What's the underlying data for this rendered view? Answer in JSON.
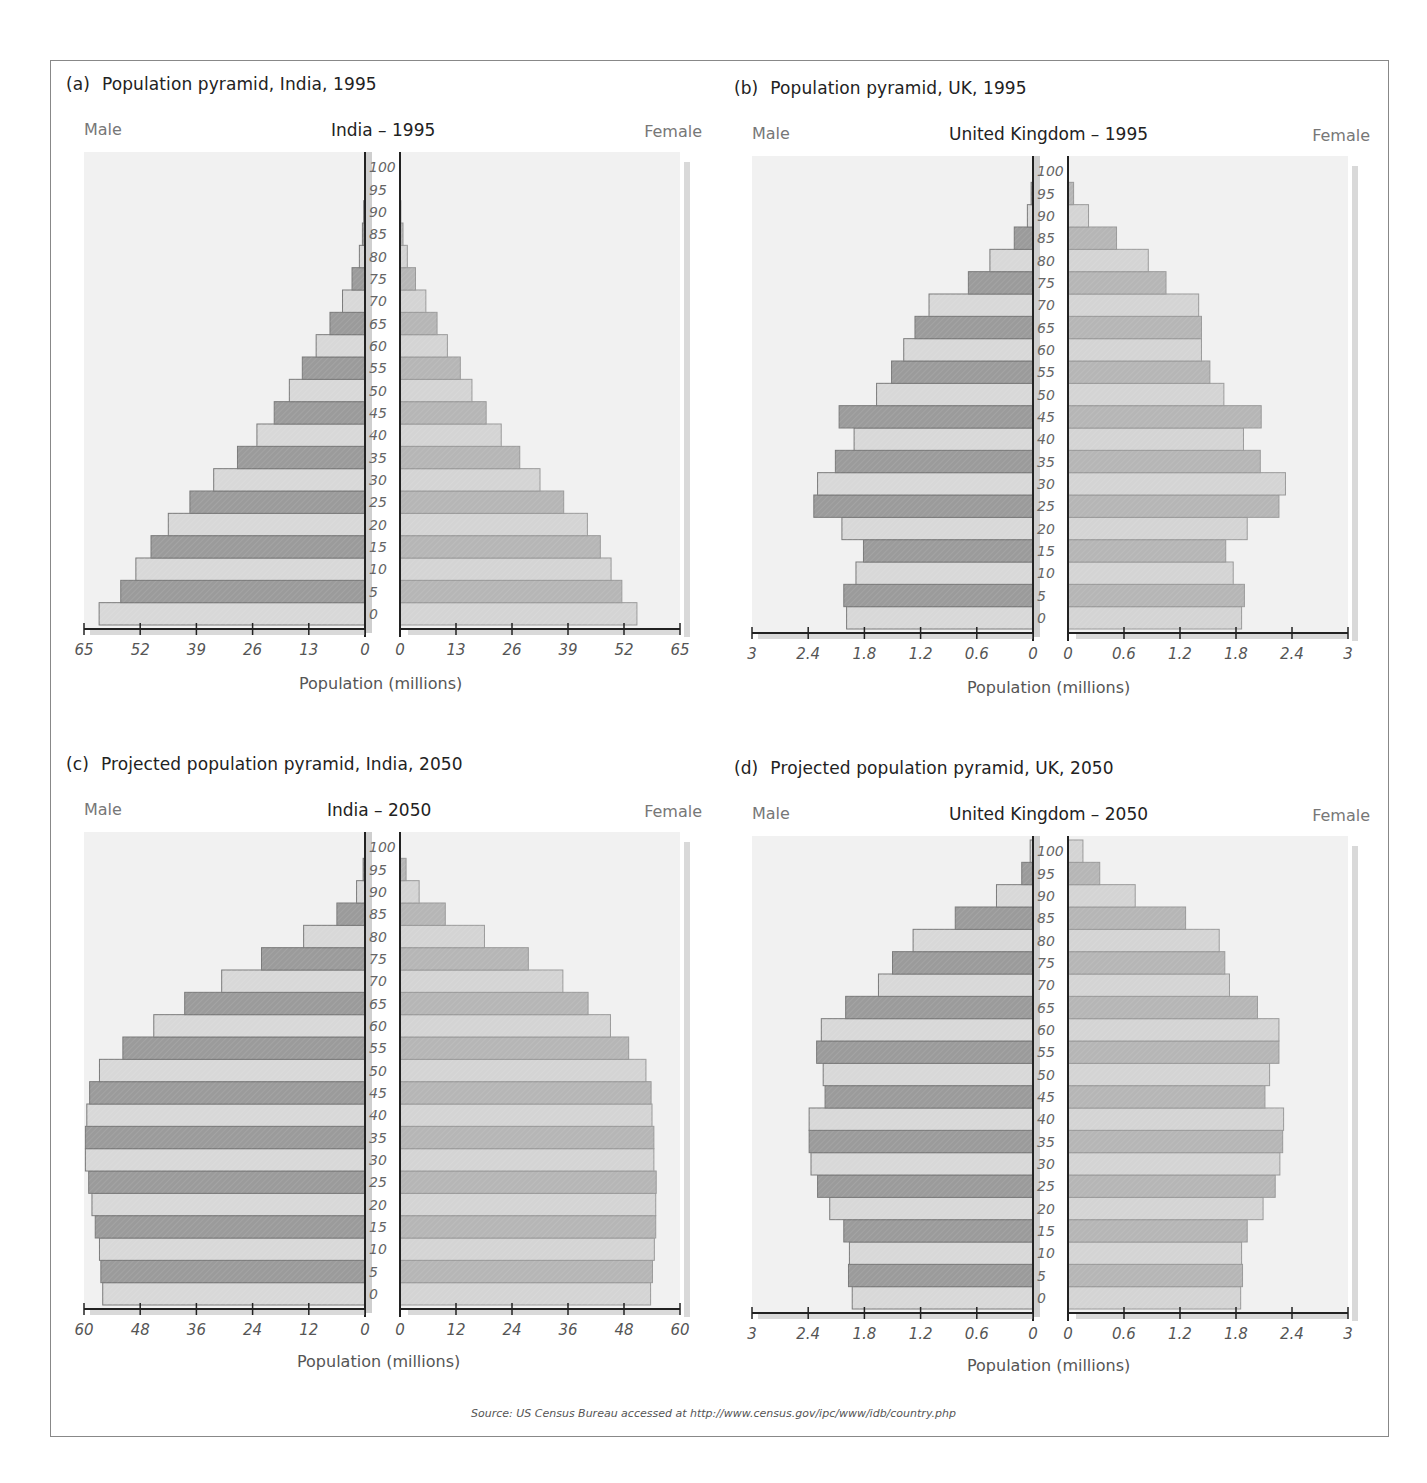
{
  "source": "Source: US Census Bureau accessed at http://www.census.gov/ipc/www/idb/country.php",
  "colors": {
    "male_dark": "#9b9b9b",
    "male_light": "#d8d8d8",
    "female_dark": "#b6b6b6",
    "female_light": "#d4d4d4",
    "bar_border": "#7a7a7a",
    "plot_bg": "#f1f1f1",
    "axis": "#222222",
    "shadow": "#d9d9d9"
  },
  "panels": [
    {
      "tag": "(a)",
      "title": "Population pyramid, India, 1995",
      "country_label": "India – 1995",
      "male_label": "Male",
      "female_label": "Female",
      "xlabel": "Population (millions)"
    },
    {
      "tag": "(b)",
      "title": "Population pyramid, UK, 1995",
      "country_label": "United Kingdom – 1995",
      "male_label": "Male",
      "female_label": "Female",
      "xlabel": "Population (millions)"
    },
    {
      "tag": "(c)",
      "title": "Projected population pyramid, India, 2050",
      "country_label": "India – 2050",
      "male_label": "Male",
      "female_label": "Female",
      "xlabel": "Population (millions)"
    },
    {
      "tag": "(d)",
      "title": "Projected population pyramid, UK, 2050",
      "country_label": "United Kingdom – 2050",
      "male_label": "Male",
      "female_label": "Female",
      "xlabel": "Population (millions)"
    }
  ],
  "chart_data": [
    {
      "type": "bar",
      "orientation": "horizontal-pyramid",
      "title": "Population pyramid, India, 1995",
      "subtitle": "India – 1995",
      "xlabel": "Population (millions)",
      "ylabel": "Age",
      "categories": [
        "0",
        "5",
        "10",
        "15",
        "20",
        "25",
        "30",
        "35",
        "40",
        "45",
        "50",
        "55",
        "60",
        "65",
        "70",
        "75",
        "80",
        "85",
        "90",
        "95",
        "100"
      ],
      "xlim": [
        0,
        65
      ],
      "xticks": [
        "0",
        "13",
        "26",
        "39",
        "52",
        "65"
      ],
      "series": [
        {
          "name": "Male",
          "values": [
            61.5,
            56.5,
            53.0,
            49.5,
            45.5,
            40.5,
            35.0,
            29.5,
            25.0,
            21.0,
            17.5,
            14.5,
            11.3,
            8.1,
            5.2,
            3.0,
            1.3,
            0.6,
            0.3,
            0.1,
            0.0
          ]
        },
        {
          "name": "Female",
          "values": [
            55.0,
            51.5,
            49.0,
            46.5,
            43.5,
            38.0,
            32.5,
            27.8,
            23.5,
            20.0,
            16.7,
            14.0,
            11.0,
            8.6,
            6.0,
            3.6,
            1.7,
            0.7,
            0.2,
            0.1,
            0.0
          ]
        }
      ],
      "legend": [
        "Male",
        "Female"
      ],
      "grid": false
    },
    {
      "type": "bar",
      "orientation": "horizontal-pyramid",
      "title": "Population pyramid, UK, 1995",
      "subtitle": "United Kingdom – 1995",
      "xlabel": "Population (millions)",
      "ylabel": "Age",
      "categories": [
        "0",
        "5",
        "10",
        "15",
        "20",
        "25",
        "30",
        "35",
        "40",
        "45",
        "50",
        "55",
        "60",
        "65",
        "70",
        "75",
        "80",
        "85",
        "90",
        "95",
        "100"
      ],
      "xlim": [
        0,
        3
      ],
      "xticks": [
        "0",
        "0.6",
        "1.2",
        "1.8",
        "2.4",
        "3"
      ],
      "series": [
        {
          "name": "Male",
          "values": [
            1.99,
            2.02,
            1.89,
            1.81,
            2.04,
            2.34,
            2.3,
            2.11,
            1.91,
            2.07,
            1.67,
            1.51,
            1.38,
            1.26,
            1.11,
            0.69,
            0.46,
            0.2,
            0.06,
            0.02,
            0.0
          ]
        },
        {
          "name": "Female",
          "values": [
            1.86,
            1.89,
            1.77,
            1.69,
            1.92,
            2.26,
            2.33,
            2.06,
            1.88,
            2.07,
            1.67,
            1.52,
            1.43,
            1.43,
            1.4,
            1.05,
            0.86,
            0.52,
            0.22,
            0.06,
            0.0
          ]
        }
      ],
      "legend": [
        "Male",
        "Female"
      ],
      "grid": false
    },
    {
      "type": "bar",
      "orientation": "horizontal-pyramid",
      "title": "Projected population pyramid, India, 2050",
      "subtitle": "India – 2050",
      "xlabel": "Population (millions)",
      "ylabel": "Age",
      "categories": [
        "0",
        "5",
        "10",
        "15",
        "20",
        "25",
        "30",
        "35",
        "40",
        "45",
        "50",
        "55",
        "60",
        "65",
        "70",
        "75",
        "80",
        "85",
        "90",
        "95",
        "100"
      ],
      "xlim": [
        0,
        60
      ],
      "xticks": [
        "0",
        "12",
        "24",
        "36",
        "48",
        "60"
      ],
      "series": [
        {
          "name": "Male",
          "values": [
            56.0,
            56.4,
            56.7,
            57.6,
            58.3,
            59.0,
            59.7,
            59.7,
            59.4,
            58.8,
            56.7,
            51.7,
            45.1,
            38.5,
            30.6,
            22.1,
            13.1,
            6.0,
            1.8,
            0.4,
            0.1
          ]
        },
        {
          "name": "Female",
          "values": [
            53.7,
            54.1,
            54.5,
            54.8,
            54.8,
            54.9,
            54.4,
            54.4,
            54.0,
            53.8,
            52.7,
            49.0,
            45.1,
            40.3,
            34.9,
            27.5,
            18.1,
            9.7,
            4.1,
            1.3,
            0.1
          ]
        }
      ],
      "legend": [
        "Male",
        "Female"
      ],
      "grid": false
    },
    {
      "type": "bar",
      "orientation": "horizontal-pyramid",
      "title": "Projected population pyramid, UK, 2050",
      "subtitle": "United Kingdom – 2050",
      "xlabel": "Population (millions)",
      "ylabel": "Age",
      "categories": [
        "0",
        "5",
        "10",
        "15",
        "20",
        "25",
        "30",
        "35",
        "40",
        "45",
        "50",
        "55",
        "60",
        "65",
        "70",
        "75",
        "80",
        "85",
        "90",
        "95",
        "100"
      ],
      "xlim": [
        0,
        3
      ],
      "xticks": [
        "0",
        "0.6",
        "1.2",
        "1.8",
        "2.4",
        "3"
      ],
      "series": [
        {
          "name": "Male",
          "values": [
            1.93,
            1.97,
            1.96,
            2.02,
            2.17,
            2.3,
            2.37,
            2.39,
            2.39,
            2.22,
            2.24,
            2.31,
            2.26,
            2.0,
            1.65,
            1.5,
            1.28,
            0.83,
            0.39,
            0.12,
            0.03
          ]
        },
        {
          "name": "Female",
          "values": [
            1.85,
            1.87,
            1.86,
            1.92,
            2.09,
            2.22,
            2.27,
            2.3,
            2.31,
            2.11,
            2.16,
            2.26,
            2.26,
            2.03,
            1.73,
            1.68,
            1.62,
            1.26,
            0.72,
            0.34,
            0.16
          ]
        }
      ],
      "legend": [
        "Male",
        "Female"
      ],
      "grid": false
    }
  ]
}
